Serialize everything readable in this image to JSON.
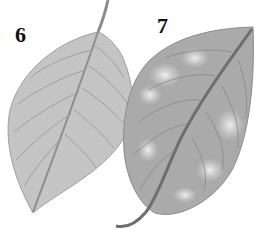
{
  "figure": {
    "leaves": [
      {
        "label": "6",
        "condition": "healthy",
        "color": "#c4c4c4"
      },
      {
        "label": "7",
        "condition": "mottled / blotched",
        "color": "#a8a8a8",
        "blotch_color": "#e6e6e6"
      }
    ]
  }
}
